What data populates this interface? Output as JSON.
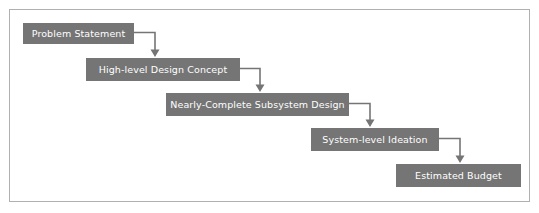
{
  "diagram": {
    "type": "cascading-flowchart",
    "title": "",
    "frame": {
      "border_color": "#b0b0b0",
      "background_color": "#ffffff"
    },
    "node_style": {
      "fill_color": "#757575",
      "text_color": "#ffffff"
    },
    "connector_style": {
      "line_color": "#757575",
      "arrow_color": "#757575",
      "shape": "elbow-right-then-down"
    },
    "nodes": [
      {
        "id": "problem-statement",
        "label": "Problem Statement",
        "x": 22,
        "y": 22,
        "width": 111,
        "height": 21
      },
      {
        "id": "high-level-design-concept",
        "label": "High-level Design Concept",
        "x": 85,
        "y": 57,
        "width": 154,
        "height": 23
      },
      {
        "id": "nearly-complete-subsystem-design",
        "label": "Nearly-Complete Subsystem Design",
        "x": 165,
        "y": 92,
        "width": 183,
        "height": 23
      },
      {
        "id": "system-level-ideation",
        "label": "System-level Ideation",
        "x": 310,
        "y": 127,
        "width": 128,
        "height": 23
      },
      {
        "id": "estimated-budget",
        "label": "Estimated Budget",
        "x": 395,
        "y": 163,
        "width": 125,
        "height": 23
      }
    ],
    "edges": [
      {
        "id": "edge-1",
        "from": "problem-statement",
        "to": "high-level-design-concept",
        "path": "M 133 32.5 L 155 32.5 L 155 51",
        "arrow": "155,57 151,50 159,50"
      },
      {
        "id": "edge-2",
        "from": "high-level-design-concept",
        "to": "nearly-complete-subsystem-design",
        "path": "M 239 68.5 L 260 68.5 L 260 86",
        "arrow": "260,92 256,85 264,85"
      },
      {
        "id": "edge-3",
        "from": "nearly-complete-subsystem-design",
        "to": "system-level-ideation",
        "path": "M 348 103.5 L 370 103.5 L 370 121",
        "arrow": "370,127 366,120 374,120"
      },
      {
        "id": "edge-4",
        "from": "system-level-ideation",
        "to": "estimated-budget",
        "path": "M 438 138.5 L 460 138.5 L 460 157",
        "arrow": "460,163 456,156 464,156"
      }
    ]
  }
}
